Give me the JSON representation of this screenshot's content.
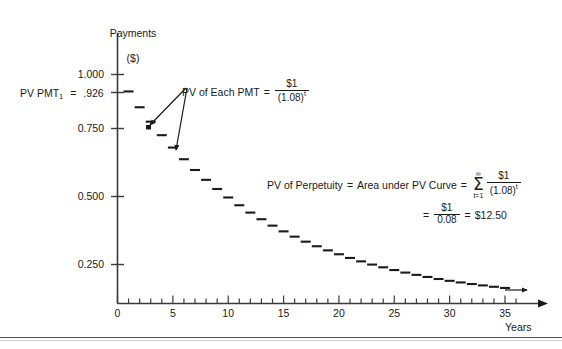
{
  "chart_data": {
    "type": "scatter",
    "title": "",
    "ylabel": "Payments\n($)",
    "xlabel": "Years",
    "xlim": [
      0,
      36.5
    ],
    "ylim": [
      0,
      1.08
    ],
    "grid": false,
    "legend": "none",
    "x_ticks_major": [
      0,
      5,
      10,
      15,
      20,
      25,
      30,
      35
    ],
    "x_tick_labels": [
      "0",
      "5",
      "10",
      "15",
      "20",
      "25",
      "30",
      "35"
    ],
    "x_minor_tick_step": 1,
    "y_ticks": [
      0.25,
      0.5,
      0.75,
      0.926,
      1.0
    ],
    "y_tick_labels": [
      "0.250",
      "0.500",
      "0.750",
      "",
      "1.000"
    ],
    "series": [
      {
        "name": "PV of Each PMT",
        "marker": "dash",
        "x": [
          1,
          2,
          3,
          4,
          5,
          6,
          7,
          8,
          9,
          10,
          11,
          12,
          13,
          14,
          15,
          16,
          17,
          18,
          19,
          20,
          21,
          22,
          23,
          24,
          25,
          26,
          27,
          28,
          29,
          30,
          31,
          32,
          33,
          34,
          35
        ],
        "values": [
          0.926,
          0.857,
          0.794,
          0.735,
          0.681,
          0.63,
          0.583,
          0.54,
          0.5,
          0.463,
          0.429,
          0.397,
          0.368,
          0.34,
          0.315,
          0.292,
          0.27,
          0.25,
          0.232,
          0.215,
          0.199,
          0.184,
          0.17,
          0.158,
          0.146,
          0.135,
          0.125,
          0.116,
          0.107,
          0.099,
          0.092,
          0.085,
          0.079,
          0.073,
          0.068
        ]
      }
    ],
    "annotations": [
      {
        "name": "pv-pmt1-callout",
        "text": "PV PMT1 = .926",
        "points_to_y": 0.926
      },
      {
        "name": "pv-each-pmt-formula",
        "text": "PV of Each PMT = $1 / (1.08)^t",
        "arrow_targets": [
          4,
          6
        ]
      },
      {
        "name": "pv-perpetuity-formula",
        "text": "PV of Perpetuity = Area under PV Curve = SUM(t=1..infinity) $1/(1.08)^t = $1/0.08 = $12.50"
      }
    ]
  },
  "axis": {
    "y_title_line1": "Payments",
    "y_title_line2": "($)",
    "x_title": "Years",
    "y_labels": {
      "t1000": "1.000",
      "t0750": "0.750",
      "t0500": "0.500",
      "t0250": "0.250"
    },
    "x_labels": [
      "0",
      "5",
      "10",
      "15",
      "20",
      "25",
      "30",
      "35"
    ]
  },
  "callouts": {
    "pv_pmt1": {
      "prefix": "PV PMT",
      "subscript": "1",
      "equals": "=",
      "value": ".926"
    },
    "each_pmt": {
      "label": "PV of Each PMT",
      "equals": "=",
      "numerator": "$1",
      "denominator": "(1.08)",
      "exponent": "t"
    },
    "perpetuity": {
      "label": "PV of Perpetuity",
      "equals1": "=",
      "middle": "Area under PV Curve",
      "equals2": "=",
      "sigma_top": "∞",
      "sigma_symbol": "Σ",
      "sigma_bottom": "t=1",
      "numerator": "$1",
      "denominator": "(1.08)",
      "exponent": "t",
      "equals3": "=",
      "numerator2": "$1",
      "denominator2": "0.08",
      "equals4": "=",
      "result": "$12.50"
    }
  },
  "colors": {
    "ink": "#1a1a1a",
    "rule": "#555555",
    "rule_light": "#cfcfcf"
  }
}
